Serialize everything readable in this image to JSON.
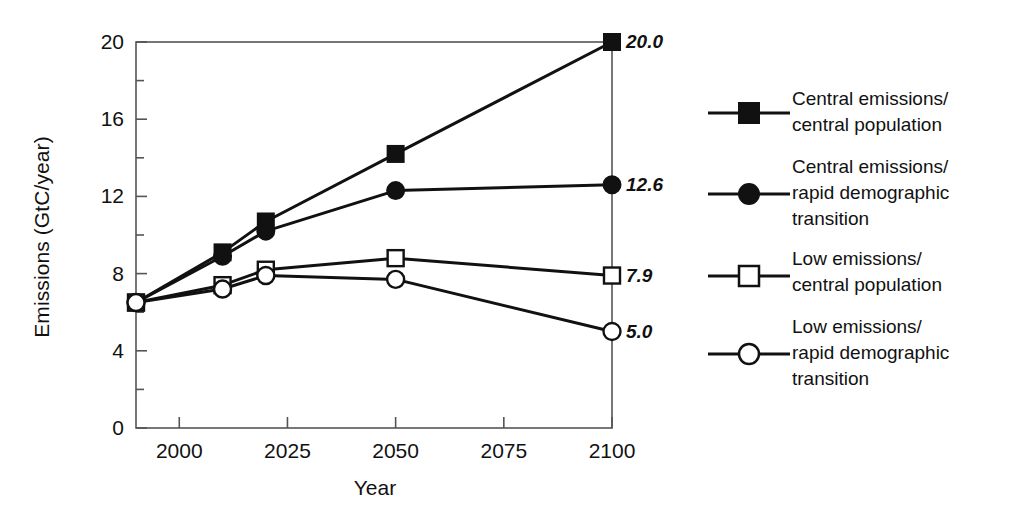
{
  "chart_data": {
    "type": "line",
    "title": "",
    "xlabel": "Year",
    "ylabel": "Emissions (GtC/year)",
    "xlim": [
      1990,
      2100
    ],
    "ylim": [
      0,
      20
    ],
    "x_ticks": [
      "2000",
      "2025",
      "2050",
      "2075",
      "2100"
    ],
    "x_tick_values": [
      2000,
      2025,
      2050,
      2075,
      2100
    ],
    "y_ticks": [
      "0",
      "4",
      "8",
      "12",
      "16",
      "20"
    ],
    "y_tick_values": [
      0,
      4,
      8,
      12,
      16,
      20
    ],
    "y_minor_step": 2,
    "grid": false,
    "legend_position": "right",
    "x": [
      1990,
      2010,
      2020,
      2050,
      2100
    ],
    "series": [
      {
        "name": "Central emissions/\ncentral population",
        "marker": "filled-square",
        "values": [
          6.5,
          9.1,
          10.7,
          14.2,
          20.0
        ],
        "end_label": "20.0"
      },
      {
        "name": "Central emissions/\nrapid demographic\ntransition",
        "marker": "filled-circle",
        "values": [
          6.5,
          8.9,
          10.2,
          12.3,
          12.6
        ],
        "end_label": "12.6"
      },
      {
        "name": "Low emissions/\ncentral population",
        "marker": "open-square",
        "values": [
          6.5,
          7.4,
          8.2,
          8.8,
          7.9
        ],
        "end_label": "7.9"
      },
      {
        "name": "Low emissions/\nrapid demographic\ntransition",
        "marker": "open-circle",
        "values": [
          6.5,
          7.2,
          7.9,
          7.7,
          5.0
        ],
        "end_label": "5.0"
      }
    ],
    "colors": {
      "line": "#111111",
      "marker_fill": "#111111",
      "marker_open_fill": "#ffffff",
      "axis": "#555555",
      "background": "#ffffff"
    }
  }
}
